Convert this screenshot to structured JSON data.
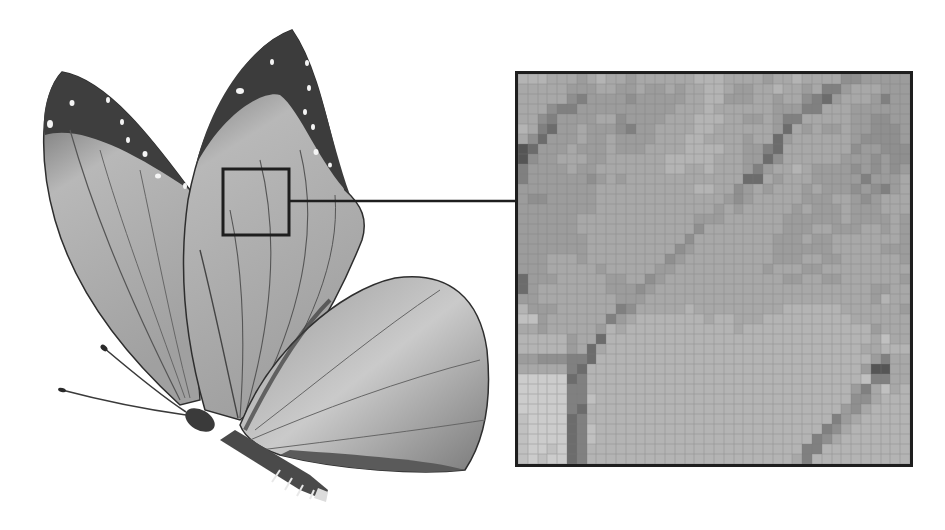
{
  "figure": {
    "colors": {
      "background": "#ffffff",
      "frame": "#1e1e1e",
      "wing_light": "#c8c8c8",
      "wing_mid": "#9a9a9a",
      "wing_dark": "#3c3c3c",
      "spot": "#f4f4f4"
    },
    "source_box": {
      "x": 222,
      "y": 168,
      "w": 68,
      "h": 68
    },
    "connector": {
      "x1": 290,
      "y1": 201,
      "x2": 515,
      "y2": 201
    },
    "zoom_box": {
      "x": 515,
      "y": 71,
      "w": 398,
      "h": 396
    },
    "pixel_grid": {
      "cols": 40,
      "rows": 39,
      "palette": {
        "0": "#3a3a3a",
        "1": "#555555",
        "2": "#6c6c6c",
        "3": "#808080",
        "4": "#8f8f8f",
        "5": "#9c9c9c",
        "6": "#a8a8a8",
        "7": "#b4b4b4",
        "8": "#c0c0c0",
        "9": "#cccccc",
        "a": "#d8d8d8"
      },
      "rows_data": [
        "7776665676656666667776666566766664455555",
        "6666655566556556566776556676656335666555",
        "6666643555545555566775556656643256665355",
        "6664335555555555666766666655533666555555",
        "6643555566455556667776655653366666554455",
        "7632556555435566667766666652656556554445",
        "6425556556555566677666656625666666544445",
        "1255565556555666677776655326666666455444",
        "1455666556666667777766655246666665554544",
        "3555565566666667766766653566765555454545",
        "3555555456566666666666622656665555535556",
        "5555555566666666667766456566656555454356",
        "5445555566666666666665456666655566545666",
        "5555555566666666666656566666565556555666",
        "5555556666666666665556666665555556555565",
        "5555556666666666664666666665556655566565",
        "5555555666666666646666666655565566666665",
        "5555555666666666456666666655555566666555",
        "5556665666666664566666666655566556666665",
        "5556666656666655666666666566655666666666",
        "2555666665566456666666666665566556666665",
        "2566666665554566666666666666666666665566",
        "5566666666555666666666666666666666665766",
        "7555666666346666676666666667777776666665",
        "8856666663567777777677666777777777666666",
        "6656666657677777777777677777777777775666",
        "7777756627777777777777777777777777776866",
        "7777756267777777777777777777777777766777",
        "5544433277777777777777777777777777775366",
        "6666632777777777777777777777777777751166",
        "9999923777777777777777777777777777783366",
        "9999933777777777777777777777777777536867",
        "9999933877777777777777777777777777446777",
        "9999932777777777777777777777777775467777",
        "8999923777777777777777777777777735677777",
        "8999923877777777777777777777777346777777",
        "8999923877777777777777777777773467777777",
        "8998923777777777777777777777733777777777",
        "8989923777777777777777777777637777777777"
      ]
    }
  }
}
